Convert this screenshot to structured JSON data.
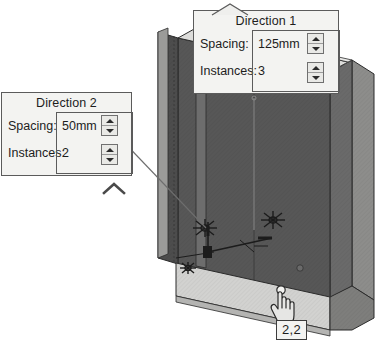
{
  "app": {
    "background_color": "#ffffff"
  },
  "model": {
    "name": "isometric-sheet-metal-part",
    "colors": {
      "face_dark": "#4a4a4a",
      "face_mid": "#6f6f6f",
      "face_light": "#c9c9c7",
      "face_top": "#e2e2e0",
      "edge": "#2b2b2b",
      "hole": "#6a6a6a"
    }
  },
  "callouts": [
    {
      "id": "direction-1",
      "title": "Direction 1",
      "fields": [
        {
          "label": "Spacing:",
          "value": "125mm"
        },
        {
          "label": "Instances:",
          "value": "3"
        }
      ]
    },
    {
      "id": "direction-2",
      "title": "Direction 2",
      "fields": [
        {
          "label": "Spacing:",
          "value": "50mm"
        },
        {
          "label": "Instances:",
          "value": "2"
        }
      ]
    }
  ],
  "badge": {
    "label": "2,2"
  },
  "icons": {
    "spin_up": "spinner-up-arrow",
    "spin_down": "spinner-down-arrow",
    "chevron_up": "chevron-up-icon",
    "hand": "hand-pointer-cursor"
  }
}
